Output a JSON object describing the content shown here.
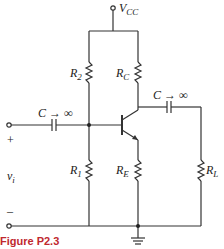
{
  "diagram": {
    "supply": {
      "label": "V",
      "sub": "CC"
    },
    "resistors": {
      "r2": {
        "label": "R",
        "sub": "2"
      },
      "rc": {
        "label": "R",
        "sub": "C"
      },
      "r1": {
        "label": "R",
        "sub": "1"
      },
      "re": {
        "label": "R",
        "sub": "E"
      },
      "rl": {
        "label": "R",
        "sub": "L"
      }
    },
    "capacitors": {
      "input": {
        "label": "C → ∞"
      },
      "output": {
        "label": "C → ∞"
      }
    },
    "input": {
      "plus": "+",
      "minus": "–",
      "label": "v",
      "sub": "i"
    },
    "caption": "Figure P2.3"
  }
}
